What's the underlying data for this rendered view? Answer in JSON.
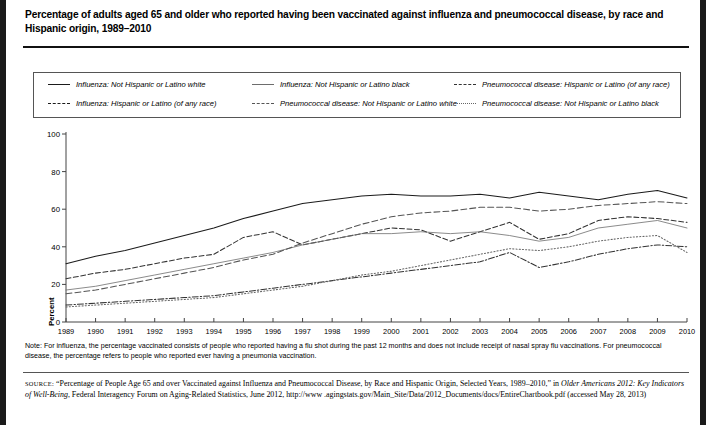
{
  "title": "Percentage of adults aged 65 and older who reported having been vaccinated against influenza and pneumococcal disease, by race and Hispanic origin, 1989–2010",
  "note": "Note: For influenza, the percentage vaccinated consists of people who reported having a flu shot during the past 12 months and does not include receipt of nasal spray flu vaccinations. For pneumococcal disease, the percentage refers to people who reported ever having a pneumonia vaccination.",
  "source": {
    "label": "SOURCE:",
    "text_1": "“Percentage of People Age 65 and over Vaccinated against Influenza and Pneumococcal Disease, by Race and Hispanic Origin, Selected Years, 1989–2010,” in ",
    "italic_1": "Older Americans 2012: Key Indicators of Well-Being",
    "text_2": ", Federal Interagency Forum on Aging-Related Statistics, June 2012, http://www .agingstats.gov/Main_Site/Data/2012_Documents/docs/EntireChartbook.pdf (accessed May 28, 2013)"
  },
  "chart_data": {
    "type": "line",
    "title": "Percentage of adults aged 65 and older who reported having been vaccinated against influenza and pneumococcal disease, by race and Hispanic origin, 1989–2010",
    "xlabel": "",
    "ylabel": "Percent",
    "ylim": [
      0,
      100
    ],
    "yticks": [
      0,
      20,
      40,
      60,
      80,
      100
    ],
    "grid": false,
    "legend_position": "top",
    "x": [
      1989,
      1990,
      1991,
      1992,
      1993,
      1994,
      1995,
      1996,
      1997,
      1998,
      1999,
      2000,
      2001,
      2002,
      2003,
      2004,
      2005,
      2006,
      2007,
      2008,
      2009,
      2010
    ],
    "series": [
      {
        "name": "Influenza: Not Hispanic or Latino white",
        "style": "solid",
        "color": "#1b1b1b",
        "values": [
          31,
          35,
          38,
          42,
          46,
          50,
          55,
          59,
          63,
          65,
          67,
          68,
          67,
          67,
          68,
          66,
          69,
          67,
          65,
          68,
          70,
          66
        ]
      },
      {
        "name": "Influenza: Hispanic or Latino (of any race)",
        "style": "dashed",
        "color": "#333333",
        "values": [
          23,
          26,
          28,
          31,
          34,
          36,
          45,
          48,
          41,
          44,
          47,
          50,
          49,
          43,
          48,
          53,
          44,
          47,
          54,
          56,
          55,
          53
        ]
      },
      {
        "name": "Influenza: Not Hispanic or Latino black",
        "style": "thin-solid",
        "color": "#6d6d6d",
        "values": [
          17,
          19,
          22,
          25,
          28,
          31,
          34,
          37,
          41,
          44,
          47,
          47,
          48,
          47,
          48,
          46,
          43,
          45,
          50,
          52,
          54,
          50
        ]
      },
      {
        "name": "Pneumococcal disease: Not Hispanic or Latino white",
        "style": "long-dashed",
        "color": "#555555",
        "values": [
          15,
          17,
          20,
          23,
          26,
          29,
          33,
          36,
          42,
          47,
          52,
          56,
          58,
          59,
          61,
          61,
          59,
          60,
          62,
          63,
          64,
          63
        ]
      },
      {
        "name": "Pneumococcal disease: Hispanic or Latino (of any race)",
        "style": "dash-dot",
        "color": "#333333",
        "values": [
          9,
          10,
          11,
          12,
          13,
          14,
          16,
          18,
          20,
          22,
          24,
          26,
          28,
          30,
          32,
          37,
          29,
          32,
          36,
          39,
          41,
          40
        ]
      },
      {
        "name": "Pneumococcal disease: Not Hispanic or Latino black",
        "style": "dotted",
        "color": "#666666",
        "values": [
          8,
          9,
          10,
          11,
          12,
          13,
          15,
          17,
          19,
          22,
          25,
          27,
          30,
          33,
          36,
          39,
          38,
          40,
          43,
          45,
          46,
          37
        ]
      }
    ]
  },
  "legend": {
    "items": [
      {
        "label": "Influenza: Not Hispanic or Latino white",
        "style": "solid"
      },
      {
        "label": "Influenza: Not Hispanic or Latino black",
        "style": "thin-solid"
      },
      {
        "label": "Pneumococcal disease: Hispanic or Latino (of any race)",
        "style": "dash-dot"
      },
      {
        "label": "Influenza: Hispanic or Latino (of any race)",
        "style": "dashed"
      },
      {
        "label": "Pneumococcal disease: Not Hispanic or Latino white",
        "style": "long-dashed"
      },
      {
        "label": "Pneumococcal disease: Not Hispanic or Latino black",
        "style": "dotted"
      }
    ]
  }
}
